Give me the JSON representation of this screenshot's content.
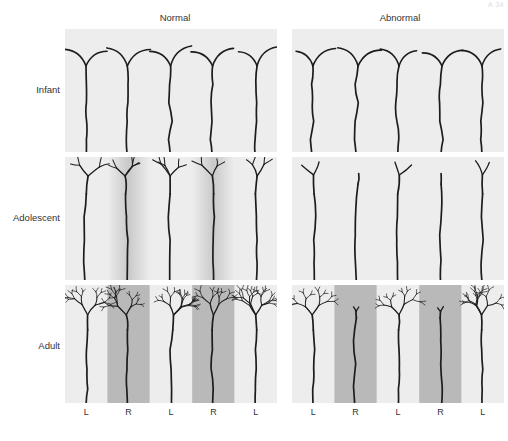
{
  "figure": {
    "corner_mark": "A 34",
    "columns": [
      {
        "id": "normal",
        "label": "Normal"
      },
      {
        "id": "abnormal",
        "label": "Abnormal"
      }
    ],
    "rows": [
      {
        "id": "infant",
        "label": "Infant"
      },
      {
        "id": "adolescent",
        "label": "Adolescent"
      },
      {
        "id": "adult",
        "label": "Adult"
      }
    ],
    "axis_labels": [
      "L",
      "R",
      "L",
      "R",
      "L"
    ],
    "colors": {
      "band_light": "#ededed",
      "band_dark": "#b9b9b9",
      "panel_bg": "#ededed",
      "stroke": "#1c1c1c",
      "text": "#333333",
      "page_bg": "#ffffff"
    }
  },
  "chart_data": {
    "type": "diagram",
    "subtitle": "Normal versus abnormal visual experience across age",
    "xlabel": "Ocular dominance column",
    "ylabel": "Developmental stage",
    "grid": false,
    "legend_position": "none",
    "column_order": [
      "L",
      "R",
      "L",
      "R",
      "L"
    ],
    "column_shading": [
      "light",
      "dark",
      "light",
      "dark",
      "light"
    ],
    "series": [
      {
        "name": "Normal",
        "stages": [
          {
            "stage": "Infant",
            "branch_order": 1,
            "arbor_density": "sparse",
            "arbor_spread": "wide-unsegregated",
            "trunk_count": 5,
            "note": "Axon terminals overlap both L and R columns; simple Y bifurcations only."
          },
          {
            "stage": "Adolescent",
            "branch_order": 3,
            "arbor_density": "intermediate",
            "arbor_spread": "partially-segregated",
            "trunk_count": 5,
            "note": "Branching increases; arbors begin to restrict to their own column."
          },
          {
            "stage": "Adult",
            "branch_order": 5,
            "arbor_density": "dense",
            "arbor_spread": "segregated",
            "trunk_count": 5,
            "note": "Fully elaborated, equally dense arbors confined to each column."
          }
        ]
      },
      {
        "name": "Abnormal",
        "stages": [
          {
            "stage": "Infant",
            "branch_order": 1,
            "arbor_density": "sparse",
            "arbor_spread": "wide-unsegregated",
            "trunk_count": 5,
            "note": "Identical to normal at birth; deprivation has not yet acted."
          },
          {
            "stage": "Adolescent",
            "branch_order": 2,
            "arbor_density": "reduced",
            "arbor_spread": "asymmetric",
            "trunk_count": 5,
            "note": "Deprived-eye (R) arbors fail to elaborate; open-eye arbors expand."
          },
          {
            "stage": "Adult",
            "branch_order": 5,
            "arbor_density": "asymmetric",
            "arbor_spread": "shrunken-deprived",
            "trunk_count": 5,
            "note": "Deprived (R) columns stunted with few branches; non-deprived (L) columns dense and enlarged."
          }
        ]
      }
    ]
  }
}
